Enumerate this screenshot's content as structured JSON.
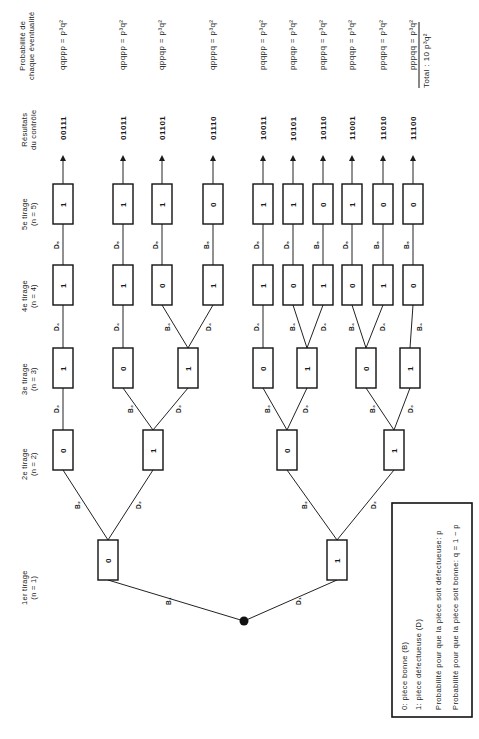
{
  "headers": {
    "level1": [
      "1er tirage",
      "(n = 1)"
    ],
    "level2": [
      "2e tirage",
      "(n = 2)"
    ],
    "level3": [
      "3e tirage",
      "(n = 3)"
    ],
    "level4": [
      "4e tirage",
      "(n = 4)"
    ],
    "level5": [
      "5e tirage",
      "(n = 5)"
    ],
    "results": [
      "Résultats",
      "du contrôle"
    ],
    "probability": [
      "Probabilité de",
      "chaque éventualité"
    ]
  },
  "tree": {
    "level1": [
      {
        "value": "0",
        "edge": "B₁"
      },
      {
        "value": "1",
        "edge": "D₁"
      }
    ],
    "level2": [
      {
        "value": "0",
        "edge": "B₂",
        "parent": 0
      },
      {
        "value": "1",
        "edge": "D₂",
        "parent": 0
      },
      {
        "value": "0",
        "edge": "B₂",
        "parent": 1
      },
      {
        "value": "1",
        "edge": "D₂",
        "parent": 1
      }
    ],
    "level3": [
      {
        "value": "1",
        "edge": "D₃",
        "parent": 0
      },
      {
        "value": "0",
        "edge": "B₃",
        "parent": 1
      },
      {
        "value": "1",
        "edge": "D₃",
        "parent": 1
      },
      {
        "value": "0",
        "edge": "B₃",
        "parent": 2
      },
      {
        "value": "1",
        "edge": "D₃",
        "parent": 2
      },
      {
        "value": "0",
        "edge": "B₃",
        "parent": 3
      },
      {
        "value": "1",
        "edge": "D₃",
        "parent": 3
      }
    ],
    "level4": [
      {
        "value": "1",
        "edge": "D₄",
        "parent": 0
      },
      {
        "value": "1",
        "edge": "D₄",
        "parent": 1
      },
      {
        "value": "0",
        "edge": "B₄",
        "parent": 2
      },
      {
        "value": "1",
        "edge": "D₄",
        "parent": 2
      },
      {
        "value": "1",
        "edge": "D₄",
        "parent": 3
      },
      {
        "value": "0",
        "edge": "B₄",
        "parent": 4
      },
      {
        "value": "1",
        "edge": "D₄",
        "parent": 4
      },
      {
        "value": "0",
        "edge": "B₄",
        "parent": 5
      },
      {
        "value": "1",
        "edge": "D₄",
        "parent": 5
      },
      {
        "value": "0",
        "edge": "B₄",
        "parent": 6
      }
    ],
    "level5": [
      {
        "value": "1",
        "edge": "D₅",
        "parent": 0
      },
      {
        "value": "1",
        "edge": "D₅",
        "parent": 1
      },
      {
        "value": "1",
        "edge": "D₅",
        "parent": 2
      },
      {
        "value": "0",
        "edge": "B₅",
        "parent": 3
      },
      {
        "value": "1",
        "edge": "D₅",
        "parent": 4
      },
      {
        "value": "1",
        "edge": "D₅",
        "parent": 5
      },
      {
        "value": "0",
        "edge": "B₅",
        "parent": 6
      },
      {
        "value": "1",
        "edge": "D₅",
        "parent": 7
      },
      {
        "value": "0",
        "edge": "B₅",
        "parent": 8
      },
      {
        "value": "0",
        "edge": "B₅",
        "parent": 9
      }
    ]
  },
  "results": [
    "00111",
    "01011",
    "01101",
    "01110",
    "10011",
    "10101",
    "10110",
    "11001",
    "11010",
    "11100"
  ],
  "probabilities": [
    "qqppp = p³q²",
    "qpqpp = p³q²",
    "qppqp = p³q²",
    "qpppq = p³q²",
    "pqqpp = p³q²",
    "pqpqp = p³q²",
    "pqppq = p³q²",
    "ppqqp = p³q²",
    "ppqpq = p³q²",
    "pppqq = p³q²"
  ],
  "total": "Total : 10  p³q²",
  "legend": [
    "0:  pièce bonne (B)",
    "1:  pièce défectueuse (D)",
    "Probabilité pour que la pièce soit défectueuse: p",
    "Probabilité pour que la pièce soit bonne: q = 1 − p"
  ]
}
